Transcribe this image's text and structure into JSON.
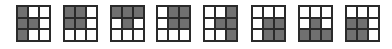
{
  "colors": {
    "filled": "#707070",
    "empty": "#ffffff",
    "border": "#2a2a2a"
  },
  "grids": [
    {
      "x": 16,
      "cells": [
        1,
        0,
        0,
        1,
        1,
        0,
        1,
        0,
        0
      ]
    },
    {
      "x": 63,
      "cells": [
        1,
        1,
        0,
        1,
        1,
        0,
        0,
        0,
        0
      ]
    },
    {
      "x": 110,
      "cells": [
        1,
        1,
        1,
        0,
        1,
        0,
        0,
        0,
        0
      ]
    },
    {
      "x": 156,
      "cells": [
        0,
        1,
        1,
        0,
        1,
        1,
        0,
        0,
        0
      ]
    },
    {
      "x": 203,
      "cells": [
        0,
        0,
        1,
        0,
        1,
        1,
        0,
        0,
        1
      ]
    },
    {
      "x": 251,
      "cells": [
        0,
        0,
        0,
        0,
        1,
        1,
        0,
        1,
        1
      ]
    },
    {
      "x": 298,
      "cells": [
        0,
        0,
        0,
        0,
        1,
        0,
        1,
        1,
        1
      ]
    },
    {
      "x": 345,
      "cells": [
        0,
        0,
        0,
        1,
        1,
        0,
        1,
        1,
        0
      ]
    }
  ]
}
